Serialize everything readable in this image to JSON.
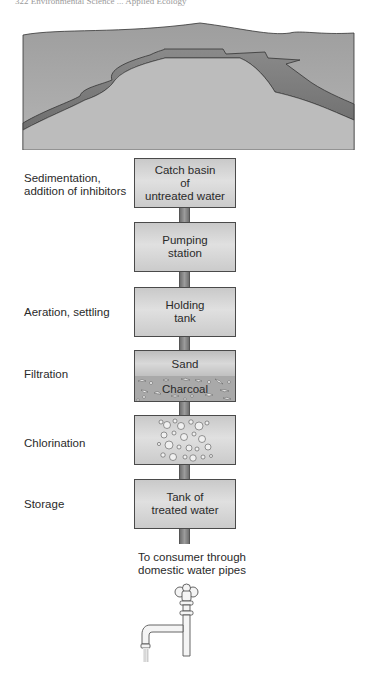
{
  "page_header": {
    "text": "322   Environmental Science ... Applied Ecology"
  },
  "figure": {
    "top_illustration": "reservoir-landscape",
    "steps": [
      {
        "process_label": "Sedimentation,\naddition of inhibitors",
        "box_label": "Catch basin\nof\nuntreated water"
      },
      {
        "process_label": "",
        "box_label": "Pumping\nstation"
      },
      {
        "process_label": "Aeration, settling",
        "box_label": "Holding\ntank"
      },
      {
        "process_label": "Filtration",
        "layers": [
          "Sand",
          "Charcoal"
        ]
      },
      {
        "process_label": "Chlorination",
        "box_label": "",
        "fill": "bubbles"
      },
      {
        "process_label": "Storage",
        "box_label": "Tank of\ntreated water"
      }
    ],
    "output_caption": "To consumer through\ndomestic water pipes",
    "bottom_illustration": "faucet"
  },
  "colors": {
    "box_fill": "#d4d4d4",
    "box_border": "#4a4a4a",
    "pipe": "#888888",
    "ground": "#a8a8a8",
    "text": "#2a2a2a"
  }
}
